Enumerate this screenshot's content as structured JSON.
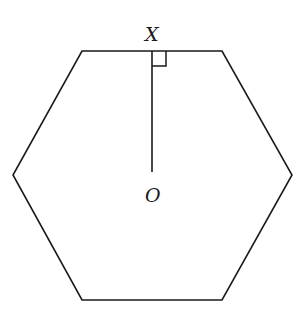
{
  "diagram": {
    "shape": "regular hexagon",
    "labels": {
      "midpoint": "X",
      "center": "O"
    },
    "elements": [
      {
        "type": "polygon",
        "name": "hexagon",
        "vertices": [
          [
            82,
            51
          ],
          [
            222,
            51
          ],
          [
            292,
            175
          ],
          [
            222,
            300
          ],
          [
            82,
            300
          ],
          [
            13,
            175
          ]
        ]
      },
      {
        "type": "segment",
        "name": "OX",
        "from": "O",
        "to": "X"
      },
      {
        "type": "right-angle-marker",
        "at": "X"
      }
    ],
    "colors": {
      "stroke": "#1a1a1a",
      "background": "#ffffff"
    }
  }
}
